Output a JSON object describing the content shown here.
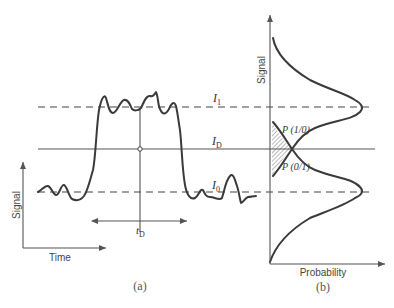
{
  "figure": {
    "panel_a": {
      "caption": "(a)",
      "y_axis_label": "Signal",
      "x_axis_label": "Time",
      "level_labels": {
        "upper": "I",
        "upper_sub": "1",
        "threshold": "I",
        "threshold_sub": "D",
        "lower": "I",
        "lower_sub": "0"
      },
      "time_label": "t",
      "time_sub": "D"
    },
    "panel_b": {
      "caption": "(b)",
      "y_axis_label": "Signal",
      "x_axis_label": "Probability",
      "error_labels": {
        "p10": "P (1/0)",
        "p01": "P (0/1)"
      }
    }
  }
}
